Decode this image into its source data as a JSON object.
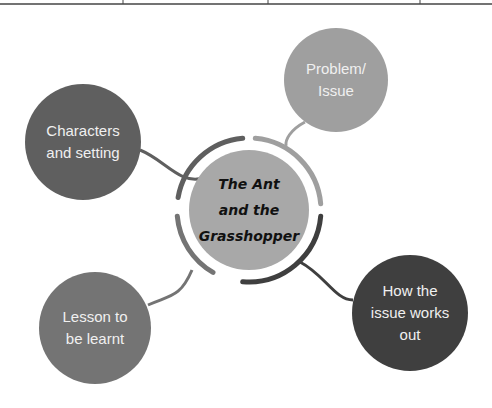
{
  "table_edge": {
    "dividers_x": [
      123,
      268,
      420
    ]
  },
  "center": {
    "title": "The Ant\nand the\nGrasshopper",
    "fill": "#a8a8a8",
    "cx": 249,
    "cy": 210,
    "r": 60,
    "ring_r": 72
  },
  "nodes": [
    {
      "id": "characters",
      "label": "Characters\nand setting",
      "fill": "#5f5f5f",
      "cx": 83,
      "cy": 142,
      "r": 58
    },
    {
      "id": "problem",
      "label": "Problem/\nIssue",
      "fill": "#9f9f9f",
      "cx": 336,
      "cy": 80,
      "r": 52
    },
    {
      "id": "resolution",
      "label": "How the\nissue works\nout",
      "fill": "#3f3f3f",
      "cx": 410,
      "cy": 313,
      "r": 58
    },
    {
      "id": "lesson",
      "label": "Lesson to\nbe learnt",
      "fill": "#747474",
      "cx": 95,
      "cy": 328,
      "r": 56
    }
  ]
}
